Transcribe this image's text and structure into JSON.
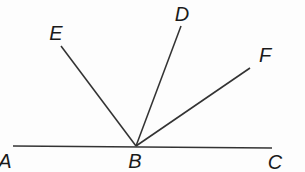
{
  "diagram": {
    "type": "geometry-angles",
    "stroke_color": "#333333",
    "label_color": "#1a1a1a",
    "vertex": {
      "name": "B",
      "x": 136,
      "y": 146
    },
    "baseline": {
      "from": {
        "name": "A",
        "x": 13,
        "y": 146
      },
      "to": {
        "name": "C",
        "x": 272,
        "y": 148
      }
    },
    "rays": [
      {
        "name": "BE",
        "end": {
          "x": 61,
          "y": 46
        }
      },
      {
        "name": "BD",
        "end": {
          "x": 181,
          "y": 26
        }
      },
      {
        "name": "BF",
        "end": {
          "x": 250,
          "y": 68
        }
      }
    ],
    "labels": {
      "A": "A",
      "B": "B",
      "C": "C",
      "D": "D",
      "E": "E",
      "F": "F"
    }
  }
}
